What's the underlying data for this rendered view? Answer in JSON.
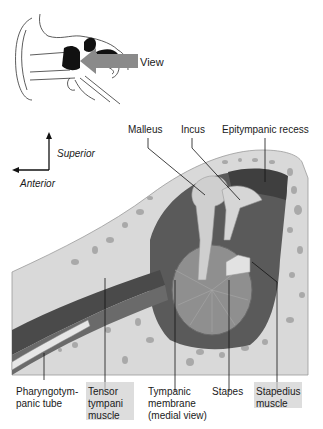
{
  "inset": {
    "view_label": "View",
    "arrow_color": "#8a8a8a"
  },
  "orientation": {
    "superior_label": "Superior",
    "anterior_label": "Anterior"
  },
  "labels_top": {
    "malleus": "Malleus",
    "incus": "Incus",
    "epitympanic_recess": "Epitympanic recess"
  },
  "labels_bottom": {
    "pharyngotympanic_tube": "Pharyngotym-\npanic tube",
    "tensor_tympani": "Tensor\ntympani\nmuscle",
    "tympanic_membrane": "Tympanic\nmembrane\n(medial view)",
    "stapes": "Stapes",
    "stapedius": "Stapedius\nmuscle"
  },
  "colors": {
    "bone": "#d9d9d9",
    "bone_pores": "#a9a9a9",
    "cavity_dark": "#5a5a5a",
    "cavity_mid": "#7d7d7d",
    "ossicle": "#cfcfcf",
    "membrane": "#8f8f8f",
    "tube_dark": "#4a4a4a",
    "label_highlight": "#c9c9c9"
  }
}
